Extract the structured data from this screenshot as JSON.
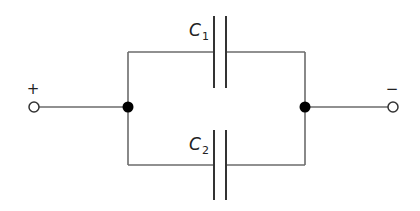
{
  "diagram": {
    "type": "circuit",
    "terminals": {
      "positive": {
        "sign": "+"
      },
      "negative": {
        "sign": "−"
      }
    },
    "capacitors": [
      {
        "id": "C1",
        "symbol": "C",
        "subscript": "1",
        "branch": "top"
      },
      {
        "id": "C2",
        "symbol": "C",
        "subscript": "2",
        "branch": "bottom"
      }
    ],
    "nodes": [
      {
        "id": "left-junction"
      },
      {
        "id": "right-junction"
      }
    ],
    "colors": {
      "wire": "#6b6b6b",
      "plate": "#333333",
      "node": "#000000",
      "background": "#ffffff"
    }
  }
}
